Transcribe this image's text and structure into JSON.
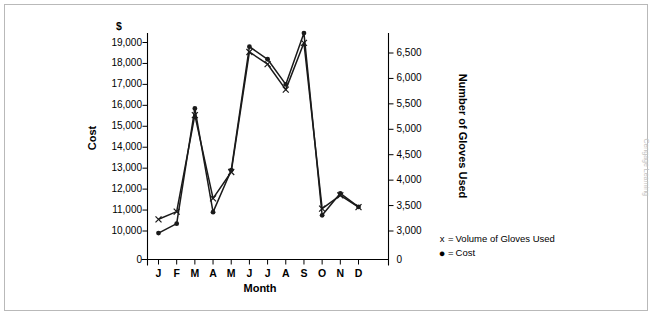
{
  "chart_data": {
    "type": "line",
    "title": "",
    "xlabel": "Month",
    "ylabel": "Cost",
    "y2label": "Number of Gloves Used",
    "currency_symbol": "$",
    "categories": [
      "J",
      "F",
      "M",
      "A",
      "M",
      "J",
      "J",
      "A",
      "S",
      "O",
      "N",
      "D"
    ],
    "ylim": [
      0,
      19500
    ],
    "y_break": true,
    "y_ticks": [
      "0",
      "10,000",
      "11,000",
      "12,000",
      "13,000",
      "14,000",
      "15,000",
      "16,000",
      "17,000",
      "18,000",
      "19,000"
    ],
    "y2lim": [
      0,
      6800
    ],
    "y2_break": true,
    "y2_ticks": [
      "0",
      "3,000",
      "3,500",
      "4,000",
      "4,500",
      "5,000",
      "5,500",
      "6,000",
      "6,500"
    ],
    "grid": false,
    "legend_position": "right",
    "series": [
      {
        "name": "Volume of Gloves Used",
        "marker": "x",
        "axis": "right",
        "values": [
          3230,
          3380,
          5280,
          3640,
          4160,
          6520,
          6280,
          5780,
          6700,
          3440,
          3700,
          3470
        ]
      },
      {
        "name": "Cost",
        "marker": "dot",
        "axis": "left",
        "values": [
          9900,
          10350,
          15850,
          10900,
          12900,
          18800,
          18200,
          17000,
          19450,
          10750,
          11800,
          11150
        ]
      }
    ]
  },
  "legend": {
    "items": [
      {
        "mark": "x",
        "equals": "=",
        "label": "Volume of Gloves Used"
      },
      {
        "mark": "●",
        "equals": "=",
        "label": "Cost"
      }
    ]
  },
  "credit": "Cengage Learning",
  "colors": {
    "line": "#1a1a1a",
    "axis": "#000000",
    "frame": "#b9b9b9",
    "background": "#ffffff",
    "credit_text": "#c2c2c2"
  }
}
